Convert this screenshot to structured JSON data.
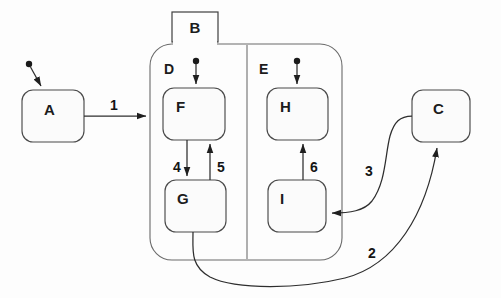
{
  "diagram": {
    "type": "uml-statechart",
    "background_color": "#fdfdfd",
    "line_color": "#2e2e2e",
    "states": [
      {
        "id": "A",
        "label": "A",
        "kind": "simple",
        "x": 22,
        "y": 90,
        "w": 62,
        "h": 52,
        "label_align": "center"
      },
      {
        "id": "B",
        "label": "B",
        "kind": "tab",
        "x": 172,
        "y": 12,
        "w": 46,
        "h": 30,
        "label_align": "center"
      },
      {
        "id": "C",
        "label": "C",
        "kind": "simple",
        "x": 412,
        "y": 90,
        "w": 58,
        "h": 52,
        "label_align": "center"
      },
      {
        "id": "D",
        "label": "D",
        "kind": "region",
        "x": 152,
        "y": 44,
        "w": 95,
        "h": 216,
        "label_align": "topleft"
      },
      {
        "id": "E",
        "label": "E",
        "kind": "region",
        "x": 247,
        "y": 44,
        "w": 95,
        "h": 216,
        "label_align": "topleft"
      },
      {
        "id": "F",
        "label": "F",
        "kind": "simple",
        "x": 163,
        "y": 88,
        "w": 62,
        "h": 52,
        "label_align": "topleft"
      },
      {
        "id": "G",
        "label": "G",
        "kind": "simple",
        "x": 165,
        "y": 180,
        "w": 61,
        "h": 52,
        "label_align": "topleft"
      },
      {
        "id": "H",
        "label": "H",
        "kind": "simple",
        "x": 267,
        "y": 88,
        "w": 61,
        "h": 52,
        "label_align": "topleft"
      },
      {
        "id": "I",
        "label": "I",
        "kind": "simple",
        "x": 268,
        "y": 180,
        "w": 58,
        "h": 52,
        "label_align": "topleft"
      }
    ],
    "composite": {
      "x": 150,
      "y": 44,
      "w": 192,
      "h": 216,
      "radius": 22,
      "divider_x": 247,
      "divider_top": 44,
      "divider_bottom": 260
    },
    "initial_pseudostates": [
      {
        "id": "init-A",
        "cx": 29,
        "cy": 64,
        "target": "A"
      },
      {
        "id": "init-D",
        "cx": 196,
        "cy": 61,
        "target": "F"
      },
      {
        "id": "init-E",
        "cx": 297,
        "cy": 61,
        "target": "H"
      }
    ],
    "transitions": [
      {
        "id": "t1",
        "label": "1",
        "from": "A",
        "to": "composite",
        "label_x": 114,
        "label_y": 106
      },
      {
        "id": "t2",
        "label": "2",
        "from": "G",
        "to": "C",
        "label_x": 372,
        "label_y": 253
      },
      {
        "id": "t3",
        "label": "3",
        "from": "C",
        "to": "I",
        "label_x": 369,
        "label_y": 171
      },
      {
        "id": "t4",
        "label": "4",
        "from": "F",
        "to": "G",
        "label_x": 175,
        "label_y": 167
      },
      {
        "id": "t5",
        "label": "5",
        "from": "G",
        "to": "F",
        "label_x": 219,
        "label_y": 167
      },
      {
        "id": "t6",
        "label": "6",
        "from": "I",
        "to": "H",
        "label_x": 312,
        "label_y": 167
      }
    ]
  }
}
